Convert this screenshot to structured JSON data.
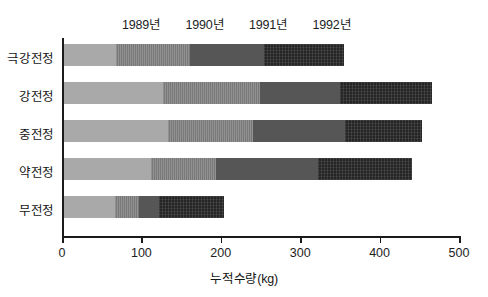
{
  "chart_data": {
    "type": "bar",
    "orientation": "horizontal",
    "stacked": true,
    "title": "",
    "xlabel": "누적수량(kg)",
    "ylabel": "",
    "xlim": [
      0,
      500
    ],
    "xticks": [
      0,
      100,
      200,
      300,
      400,
      500
    ],
    "xtick_labels": [
      "0",
      "100",
      "200",
      "300",
      "400",
      "500"
    ],
    "grid": false,
    "legend_position": "top",
    "categories": [
      "극강전정",
      "강전정",
      "중전정",
      "약전정",
      "무전정"
    ],
    "series": [
      {
        "name": "1989년",
        "color": "#a9a9a9",
        "values": [
          65,
          125,
          131,
          110,
          64
        ]
      },
      {
        "name": "1990년",
        "color": "#7f7f7f",
        "values": [
          94,
          122,
          107,
          81,
          30
        ]
      },
      {
        "name": "1991년",
        "color": "#565656",
        "values": [
          93,
          101,
          116,
          129,
          26
        ]
      },
      {
        "name": "1992년",
        "color": "#252525",
        "values": [
          101,
          115,
          97,
          118,
          82
        ]
      }
    ],
    "totals": [
      353,
      463,
      451,
      438,
      202
    ],
    "cumulative": [
      [
        65,
        159,
        252,
        353
      ],
      [
        125,
        247,
        348,
        463
      ],
      [
        131,
        238,
        354,
        451
      ],
      [
        110,
        191,
        320,
        438
      ],
      [
        64,
        94,
        120,
        202
      ]
    ],
    "legend_label_positions": [
      100,
      180,
      260,
      340
    ]
  }
}
